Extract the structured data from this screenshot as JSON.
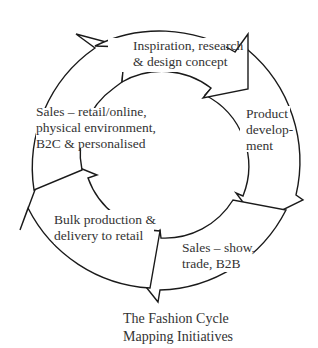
{
  "diagram": {
    "type": "cycle",
    "stages": [
      {
        "id": "inspiration",
        "label_lines": [
          "Inspiration, research",
          "& design concept"
        ]
      },
      {
        "id": "product",
        "label_lines": [
          "Product",
          "develop-",
          "ment"
        ]
      },
      {
        "id": "sales_b2b",
        "label_lines": [
          "Sales – show,",
          "trade, B2B"
        ]
      },
      {
        "id": "bulk",
        "label_lines": [
          "Bulk production &",
          "delivery to retail"
        ]
      },
      {
        "id": "sales_retail",
        "label_lines": [
          "Sales – retail/online,",
          "physical environment,",
          "B2C & personalised"
        ]
      }
    ],
    "caption_lines": [
      "The Fashion Cycle",
      "Mapping Initiatives"
    ],
    "colors": {
      "stroke": "#1a1a1a",
      "fill": "#ffffff",
      "text": "#333333"
    }
  }
}
